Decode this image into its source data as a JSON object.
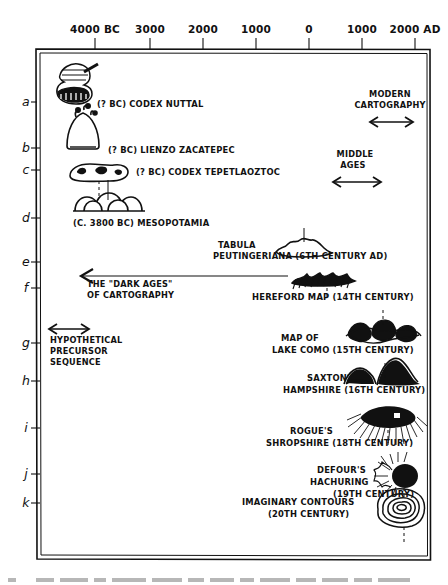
{
  "figure": {
    "domain_type": "diagram",
    "axis": {
      "name": "time-axis",
      "ticks": [
        {
          "label": "4000 BC",
          "x": 95
        },
        {
          "label": "3000",
          "x": 150
        },
        {
          "label": "2000",
          "x": 203
        },
        {
          "label": "1000",
          "x": 256
        },
        {
          "label": "0",
          "x": 309
        },
        {
          "label": "1000",
          "x": 362
        },
        {
          "label": "2000 AD",
          "x": 415
        }
      ]
    },
    "rows": [
      {
        "letter": "a",
        "y": 102
      },
      {
        "letter": "b",
        "y": 148
      },
      {
        "letter": "c",
        "y": 170
      },
      {
        "letter": "d",
        "y": 218
      },
      {
        "letter": "e",
        "y": 262
      },
      {
        "letter": "f",
        "y": 288
      },
      {
        "letter": "g",
        "y": 343
      },
      {
        "letter": "h",
        "y": 381
      },
      {
        "letter": "i",
        "y": 428
      },
      {
        "letter": "j",
        "y": 474
      },
      {
        "letter": "k",
        "y": 503
      }
    ],
    "entries": [
      {
        "id": "codex-nuttal",
        "row": "a",
        "label_lines": [
          "(? BC) CODEX NUTTAL"
        ],
        "icon": "codex-nuttal-glyph"
      },
      {
        "id": "lienzo-zacatepec",
        "row": "b",
        "label_lines": [
          "(? BC) LIENZO ZACATEPEC"
        ],
        "icon": "lienzo-zacatepec-glyph"
      },
      {
        "id": "codex-tepetlaoztoc",
        "row": "c",
        "label_lines": [
          "(? BC) CODEX TEPETLAOZTOC"
        ],
        "icon": "codex-tepetlaoztoc-glyph"
      },
      {
        "id": "mesopotamia",
        "row": "d",
        "label_lines": [
          "(C. 3800 BC) MESOPOTAMIA"
        ],
        "icon": "mesopotamia-glyph"
      },
      {
        "id": "tabula-peutingeriana",
        "row": "e",
        "label_lines": [
          "TABULA",
          "PEUTINGERIANA  (6TH CENTURY AD)"
        ],
        "icon": "tabula-peutingeriana-glyph"
      },
      {
        "id": "hereford-map",
        "row": "f",
        "label_lines": [
          "HEREFORD MAP (14TH CENTURY)"
        ],
        "icon": "hereford-map-glyph"
      },
      {
        "id": "lake-como",
        "row": "g",
        "label_lines": [
          "MAP OF",
          "LAKE COMO  (15TH CENTURY)"
        ],
        "icon": "lake-como-glyph"
      },
      {
        "id": "saxtons-hampshire",
        "row": "h",
        "label_lines": [
          "SAXTON'S",
          "HAMPSHIRE  (16TH CENTURY)"
        ],
        "icon": "saxtons-hampshire-glyph"
      },
      {
        "id": "rogues-shropshire",
        "row": "i",
        "label_lines": [
          "ROGUE'S",
          "SHROPSHIRE  (18TH CENTURY)"
        ],
        "icon": "rogues-shropshire-glyph"
      },
      {
        "id": "defours-hachuring",
        "row": "j",
        "label_lines": [
          "DEFOUR'S",
          "HACHURING",
          "(19TH CENTURY)"
        ],
        "icon": "defours-hachuring-glyph"
      },
      {
        "id": "imaginary-contours",
        "row": "k",
        "label_lines": [
          "IMAGINARY CONTOURS",
          "(20TH CENTURY)"
        ],
        "icon": "imaginary-contours-glyph"
      }
    ],
    "annotations": [
      {
        "id": "modern-cartography",
        "label_lines": [
          "MODERN",
          "CARTOGRAPHY"
        ],
        "arrow": "double-headed"
      },
      {
        "id": "middle-ages",
        "label_lines": [
          "MIDDLE",
          "AGES"
        ],
        "arrow": "double-headed"
      },
      {
        "id": "dark-ages",
        "label_lines": [
          "THE \"DARK AGES\"",
          "OF CARTOGRAPHY"
        ],
        "arrow": "left"
      },
      {
        "id": "hypothetical-precursor",
        "label_lines": [
          "HYPOTHETICAL",
          "PRECURSOR",
          "SEQUENCE"
        ],
        "arrow": "double-headed"
      }
    ]
  }
}
